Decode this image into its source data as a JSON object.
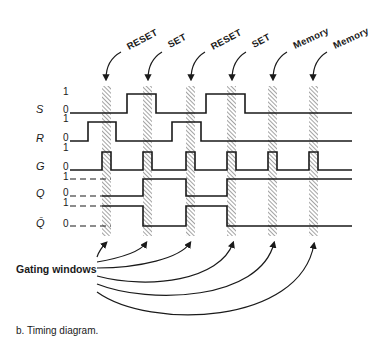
{
  "diagram": {
    "caption": "b. Timing diagram.",
    "gating_label": "Gating windows",
    "signals": [
      {
        "name": "S",
        "high_label": "1",
        "low_label": "0"
      },
      {
        "name": "R",
        "high_label": "1",
        "low_label": "0"
      },
      {
        "name": "G",
        "high_label": "1",
        "low_label": "0"
      },
      {
        "name": "Q",
        "high_label": "1",
        "low_label": "0"
      },
      {
        "name": "Q̄",
        "high_label": "1",
        "low_label": "0"
      }
    ],
    "windows": [
      {
        "label": "RESET",
        "x": 102
      },
      {
        "label": "SET",
        "x": 143
      },
      {
        "label": "RESET",
        "x": 186
      },
      {
        "label": "SET",
        "x": 227
      },
      {
        "label": "Memory",
        "x": 268
      },
      {
        "label": "Memory",
        "x": 309
      }
    ],
    "window_width": 9,
    "colors": {
      "ink": "#1a1a1a",
      "background": "#ffffff",
      "hatch": "#555555"
    }
  }
}
